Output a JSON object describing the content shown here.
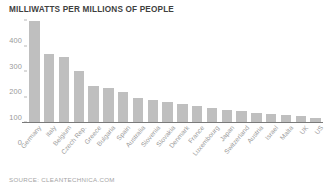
{
  "chart": {
    "title": "MILLIWATTS PER MILLIONS OF PEOPLE",
    "source": "SOURCE: CLEANTECHNICA.COM"
  },
  "chart_data": {
    "type": "bar",
    "title": "MILLIWATTS PER MILLIONS OF PEOPLE",
    "xlabel": "",
    "ylabel": "",
    "ylim": [
      0,
      400
    ],
    "yticks": [
      0,
      100,
      200,
      300,
      400
    ],
    "grid": false,
    "legend": null,
    "bar_color": "#bfbfbf",
    "categories": [
      "Germany",
      "Italy",
      "Belgium",
      "Czech Rep.",
      "Greece",
      "Bulgaria",
      "Spain",
      "Australia",
      "Slovenia",
      "Slovakia",
      "Denmark",
      "France",
      "Luxembourg",
      "Japan",
      "Switzerland",
      "Austria",
      "Israel",
      "Malta",
      "UK",
      "US"
    ],
    "values": [
      395,
      265,
      255,
      200,
      143,
      135,
      118,
      95,
      88,
      80,
      72,
      62,
      55,
      48,
      42,
      36,
      30,
      26,
      22,
      14
    ],
    "annotations": [
      "SOURCE: CLEANTECHNICA.COM"
    ]
  }
}
